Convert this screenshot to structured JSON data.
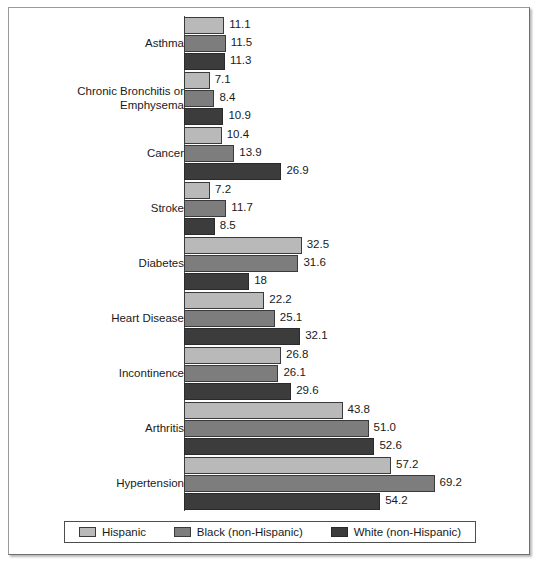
{
  "chart_data": {
    "type": "bar",
    "orientation": "horizontal",
    "title": "",
    "subtitle": "",
    "xlabel": "",
    "ylabel": "",
    "grid": false,
    "xlim": [
      0,
      72
    ],
    "legend_position": "bottom",
    "categories": [
      "Asthma",
      "Chronic Bronchitis or\nEmphysema",
      "Cancer",
      "Stroke",
      "Diabetes",
      "Heart Disease",
      "Incontinence",
      "Arthritis",
      "Hypertension"
    ],
    "series": [
      {
        "name": "Hispanic",
        "color": "#b9b9b9",
        "values": [
          11.1,
          7.1,
          10.4,
          7.2,
          32.5,
          22.2,
          26.8,
          43.8,
          57.2
        ],
        "labels": [
          "11.1",
          "7.1",
          "10.4",
          "7.2",
          "32.5",
          "22.2",
          "26.8",
          "43.8",
          "57.2"
        ]
      },
      {
        "name": "Black (non-Hispanic)",
        "color": "#7d7d7d",
        "values": [
          11.5,
          8.4,
          13.9,
          11.7,
          31.6,
          25.1,
          26.1,
          51.0,
          69.2
        ],
        "labels": [
          "11.5",
          "8.4",
          "13.9",
          "11.7",
          "31.6",
          "25.1",
          "26.1",
          "51.0",
          "69.2"
        ]
      },
      {
        "name": "White (non-Hispanic)",
        "color": "#3c3c3c",
        "values": [
          11.3,
          10.9,
          26.9,
          8.5,
          18.0,
          32.1,
          29.6,
          52.6,
          54.2
        ],
        "labels": [
          "11.3",
          "10.9",
          "26.9",
          "8.5",
          "18",
          "32.1",
          "29.6",
          "52.6",
          "54.2"
        ]
      }
    ]
  },
  "legend": {
    "items": [
      {
        "label": "Hispanic",
        "swatch": "legend-swatch-hispanic"
      },
      {
        "label": "Black (non-Hispanic)",
        "swatch": "legend-swatch-black-non-hispanic"
      },
      {
        "label": "White (non-Hispanic)",
        "swatch": "legend-swatch-white-non-hispanic"
      }
    ]
  }
}
